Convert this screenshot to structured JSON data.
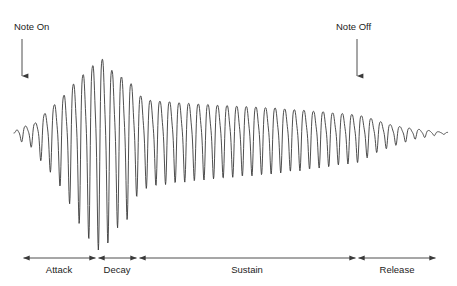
{
  "figure": {
    "kind": "adsr-envelope-waveform-diagram",
    "background_color": "#ffffff",
    "stroke_color": "#3a3a3a",
    "text_color": "#1c1c1c",
    "width": 457,
    "height": 286
  },
  "annotations": {
    "note_on": {
      "label": "Note On",
      "label_x": 14,
      "label_y": 30,
      "arrow_x": 22,
      "arrow_y_start": 39,
      "arrow_y_end": 76
    },
    "note_off": {
      "label": "Note Off",
      "label_x": 336,
      "label_y": 30,
      "arrow_x": 357,
      "arrow_y_start": 39,
      "arrow_y_end": 76
    }
  },
  "axis": {
    "y": 258,
    "boundaries": [
      22,
      97,
      138,
      357,
      437
    ],
    "label_y": 273,
    "segments": [
      {
        "name": "attack",
        "label": "Attack",
        "x_start": 22,
        "x_end": 97,
        "label_x": 59
      },
      {
        "name": "decay",
        "label": "Decay",
        "x_start": 97,
        "x_end": 138,
        "label_x": 117
      },
      {
        "name": "sustain",
        "label": "Sustain",
        "x_start": 138,
        "x_end": 357,
        "label_x": 247
      },
      {
        "name": "release",
        "label": "Release",
        "x_start": 357,
        "x_end": 437,
        "label_x": 397
      }
    ]
  },
  "chart_data": {
    "type": "line",
    "title": "",
    "xlabel": "",
    "ylabel": "",
    "grid": false,
    "legend": null,
    "baseline_y": 133,
    "x_start": 14,
    "x_end": 448,
    "cycle_px": 9.6,
    "comment": "Amplitude envelope of a musical note: ADSR. Envelope given as control points (x pixel, peak amplitude in pixels from baseline). Waveform is a two-partial oscillation scaled by the envelope.",
    "envelope_points": [
      {
        "x": 14,
        "amp": 0
      },
      {
        "x": 18,
        "amp": 7
      },
      {
        "x": 26,
        "amp": 11
      },
      {
        "x": 34,
        "amp": 15
      },
      {
        "x": 42,
        "amp": 28
      },
      {
        "x": 50,
        "amp": 38
      },
      {
        "x": 58,
        "amp": 50
      },
      {
        "x": 66,
        "amp": 62
      },
      {
        "x": 74,
        "amp": 78
      },
      {
        "x": 82,
        "amp": 92
      },
      {
        "x": 90,
        "amp": 104
      },
      {
        "x": 97,
        "amp": 113
      },
      {
        "x": 104,
        "amp": 118
      },
      {
        "x": 111,
        "amp": 100
      },
      {
        "x": 118,
        "amp": 92
      },
      {
        "x": 125,
        "amp": 86
      },
      {
        "x": 132,
        "amp": 78
      },
      {
        "x": 138,
        "amp": 60
      },
      {
        "x": 150,
        "amp": 52
      },
      {
        "x": 165,
        "amp": 50
      },
      {
        "x": 180,
        "amp": 48
      },
      {
        "x": 200,
        "amp": 46
      },
      {
        "x": 220,
        "amp": 44
      },
      {
        "x": 245,
        "amp": 42
      },
      {
        "x": 270,
        "amp": 40
      },
      {
        "x": 295,
        "amp": 37
      },
      {
        "x": 320,
        "amp": 34
      },
      {
        "x": 340,
        "amp": 31
      },
      {
        "x": 357,
        "amp": 29
      },
      {
        "x": 368,
        "amp": 24
      },
      {
        "x": 380,
        "amp": 18
      },
      {
        "x": 392,
        "amp": 13
      },
      {
        "x": 404,
        "amp": 9
      },
      {
        "x": 416,
        "amp": 6
      },
      {
        "x": 428,
        "amp": 4
      },
      {
        "x": 438,
        "amp": 2
      },
      {
        "x": 448,
        "amp": 1
      }
    ]
  }
}
